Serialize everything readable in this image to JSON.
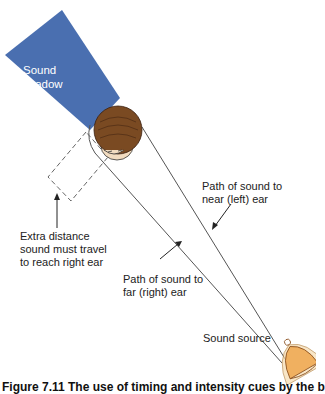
{
  "figure": {
    "caption": "Figure 7.11 The use of timing and intensity cues by the b",
    "colors": {
      "shadow": "#4a6fb0",
      "hair": "#7a4a22",
      "skin": "#f2dcc0",
      "bell": "#f0b060",
      "line": "#444444"
    }
  },
  "labels": {
    "sound_shadow": [
      "Sound",
      "shadow"
    ],
    "extra_distance": [
      "Extra distance",
      "sound must travel",
      "to reach right ear"
    ],
    "near_path": [
      "Path of sound to",
      "near (left) ear"
    ],
    "far_path": [
      "Path of sound to",
      "far (right) ear"
    ],
    "sound_source": "Sound source"
  }
}
